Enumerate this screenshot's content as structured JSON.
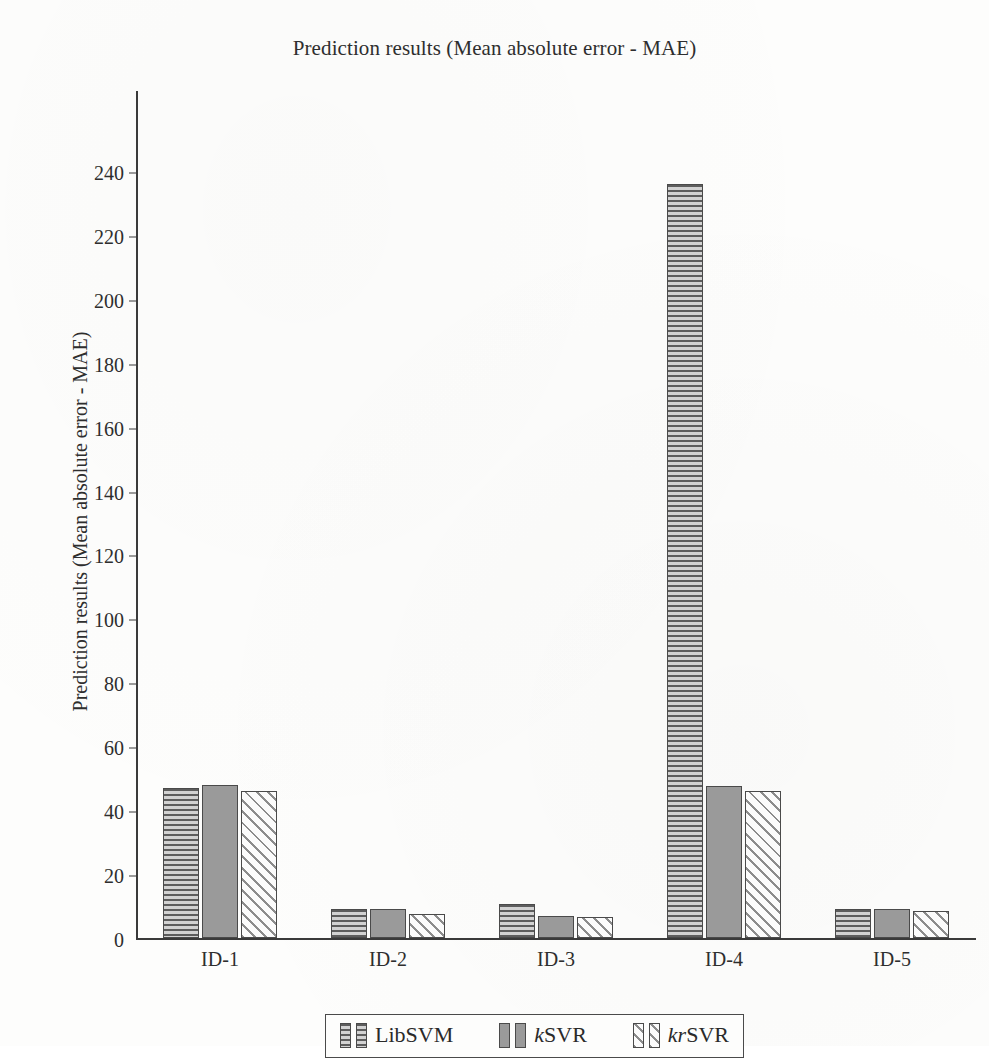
{
  "chart_data": {
    "type": "bar",
    "title": "Prediction results (Mean absolute error - MAE)",
    "xlabel": "",
    "ylabel": "Prediction results (Mean absolute error - MAE)",
    "categories": [
      "ID-1",
      "ID-2",
      "ID-3",
      "ID-4",
      "ID-5"
    ],
    "series": [
      {
        "name": "LibSVM",
        "pattern": "horizontal-stripes",
        "values": [
          47,
          9,
          10.5,
          236,
          9
        ]
      },
      {
        "name": "kSVR",
        "pattern": "solid-gray",
        "values": [
          48,
          9,
          7,
          47.5,
          9
        ]
      },
      {
        "name": "krSVR",
        "pattern": "diagonal-stripes",
        "values": [
          46,
          7.5,
          6.5,
          46,
          8.5
        ]
      }
    ],
    "ylim": [
      0,
      245
    ],
    "yticks": [
      0,
      20,
      40,
      60,
      80,
      100,
      120,
      140,
      160,
      180,
      200,
      220,
      240
    ],
    "ytick_labels": [
      "0",
      "20",
      "40",
      "60",
      "80",
      "100",
      "120",
      "140",
      "160",
      "180",
      "200",
      "220",
      "240"
    ],
    "grid": false,
    "legend_position": "bottom-center"
  },
  "legend": {
    "entries": [
      {
        "label_plain": "LibSVM",
        "label_italic": "",
        "label_rest": "LibSVM"
      },
      {
        "label_plain": "kSVR",
        "label_italic": "k",
        "label_rest": "SVR"
      },
      {
        "label_plain": "krSVR",
        "label_italic": "kr",
        "label_rest": "SVR"
      }
    ]
  }
}
